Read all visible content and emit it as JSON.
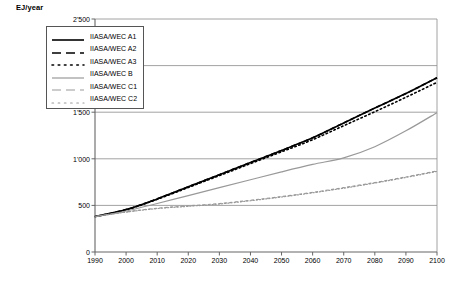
{
  "axis_title": "EJ/year",
  "legend": {
    "entries": [
      {
        "label": "IIASA/WEC A1",
        "style": "solid",
        "color": "#000000",
        "width": 1.6
      },
      {
        "label": "IIASA/WEC A2",
        "style": "dashed",
        "color": "#000000",
        "width": 1.6
      },
      {
        "label": "IIASA/WEC A3",
        "style": "dotted",
        "color": "#000000",
        "width": 1.6
      },
      {
        "label": "IIASA/WEC B",
        "style": "solid",
        "color": "#999999",
        "width": 1.2
      },
      {
        "label": "IIASA/WEC C1",
        "style": "dashed",
        "color": "#999999",
        "width": 1.2
      },
      {
        "label": "IIASA/WEC C2",
        "style": "dotted",
        "color": "#999999",
        "width": 1.2
      }
    ]
  },
  "chart_data": {
    "type": "line",
    "title": "",
    "xlabel": "",
    "ylabel": "EJ/year",
    "xlim": [
      1990,
      2100
    ],
    "ylim": [
      0,
      2500
    ],
    "grid": true,
    "legend_position": "upper-left",
    "yticks": [
      0,
      500,
      1000,
      1500,
      2000,
      2500
    ],
    "ytick_labels": [
      "0",
      "500",
      "1'000",
      "1'500",
      "2'000",
      "2'500"
    ],
    "xticks": [
      1990,
      2000,
      2010,
      2020,
      2030,
      2040,
      2050,
      2060,
      2070,
      2080,
      2090,
      2100
    ],
    "xtick_labels": [
      "1990",
      "2000",
      "2010",
      "2020",
      "2030",
      "2040",
      "2050",
      "2060",
      "2070",
      "2080",
      "2090",
      "2100"
    ],
    "x": [
      1990,
      2000,
      2010,
      2020,
      2030,
      2040,
      2050,
      2060,
      2070,
      2080,
      2090,
      2100
    ],
    "series": [
      {
        "name": "IIASA/WEC A1",
        "style": "solid",
        "color": "#000000",
        "width": 1.6,
        "values": [
          380,
          455,
          570,
          700,
          830,
          960,
          1090,
          1225,
          1385,
          1545,
          1700,
          1870
        ]
      },
      {
        "name": "IIASA/WEC A2",
        "style": "dashed",
        "color": "#000000",
        "width": 1.6,
        "values": [
          380,
          455,
          570,
          700,
          830,
          960,
          1090,
          1225,
          1385,
          1545,
          1700,
          1870
        ]
      },
      {
        "name": "IIASA/WEC A3",
        "style": "dotted",
        "color": "#000000",
        "width": 1.6,
        "values": [
          380,
          452,
          565,
          692,
          820,
          948,
          1075,
          1205,
          1355,
          1505,
          1660,
          1820
        ]
      },
      {
        "name": "IIASA/WEC B",
        "style": "solid",
        "color": "#999999",
        "width": 1.2,
        "values": [
          380,
          440,
          520,
          605,
          690,
          775,
          860,
          940,
          1010,
          1130,
          1300,
          1495
        ]
      },
      {
        "name": "IIASA/WEC C1",
        "style": "dashed",
        "color": "#999999",
        "width": 1.2,
        "values": [
          380,
          430,
          470,
          495,
          520,
          555,
          595,
          640,
          690,
          745,
          805,
          870
        ]
      },
      {
        "name": "IIASA/WEC C2",
        "style": "dotted",
        "color": "#999999",
        "width": 1.2,
        "values": [
          380,
          428,
          466,
          490,
          515,
          550,
          590,
          635,
          685,
          740,
          800,
          865
        ]
      }
    ]
  }
}
